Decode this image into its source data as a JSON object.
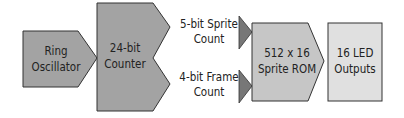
{
  "diagram": {
    "type": "block-flow",
    "blocks": [
      {
        "id": "ring-oscillator",
        "lines": [
          "Ring",
          "Oscillator"
        ],
        "color": "#a3a3a3"
      },
      {
        "id": "counter",
        "lines": [
          "24-bit",
          "Counter"
        ],
        "color": "#a3a3a3"
      },
      {
        "id": "sprite-rom",
        "lines": [
          "512 x 16",
          "Sprite ROM"
        ],
        "color": "#c6c6c6"
      },
      {
        "id": "led-outputs",
        "lines": [
          "16 LED",
          "Outputs"
        ],
        "color": "#e0e0e0"
      }
    ],
    "signals": [
      {
        "id": "sprite-count",
        "lines": [
          "5-bit Sprite",
          "Count"
        ]
      },
      {
        "id": "frame-count",
        "lines": [
          "4-bit Frame",
          "Count"
        ]
      }
    ],
    "arrow_color": "#777777",
    "stroke_color": "#333333"
  }
}
